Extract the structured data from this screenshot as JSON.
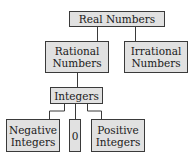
{
  "diagram": {
    "nodes": {
      "real": {
        "label": "Real Numbers"
      },
      "rational": {
        "label": "Rational Numbers"
      },
      "irrational": {
        "label": "Irrational Numbers"
      },
      "integers": {
        "label": "Integers"
      },
      "negative": {
        "label": "Negative Integers"
      },
      "zero": {
        "label": "0"
      },
      "positive": {
        "label": "Positive Integers"
      }
    },
    "edges": [
      [
        "real",
        "rational"
      ],
      [
        "real",
        "irrational"
      ],
      [
        "rational",
        "integers"
      ],
      [
        "integers",
        "negative"
      ],
      [
        "integers",
        "zero"
      ],
      [
        "integers",
        "positive"
      ]
    ],
    "colors": {
      "box_fill": "#e1e1e1",
      "box_border": "#3a3a3a",
      "line": "#3a3a3a"
    }
  }
}
